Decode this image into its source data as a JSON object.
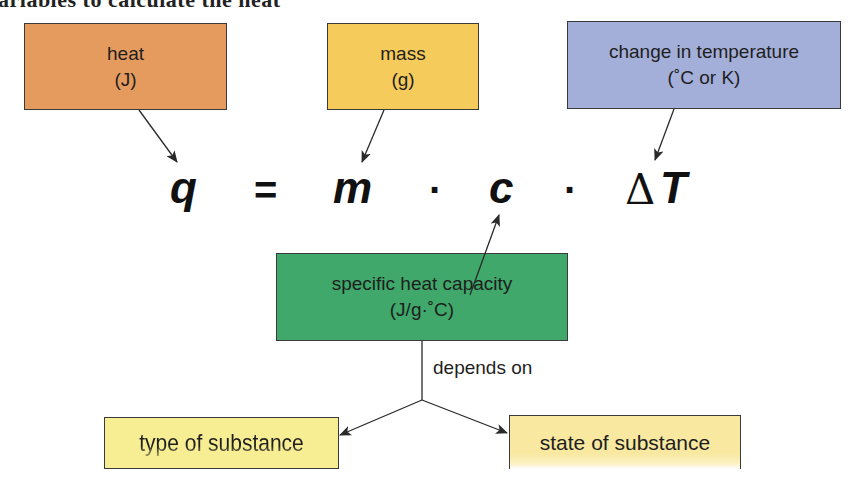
{
  "caption": {
    "partial_text": "ariables to calculate the heat"
  },
  "equation": {
    "lhs": "q",
    "equals": "=",
    "term_mass": "m",
    "dot_1": "·",
    "term_specific_heat": "c",
    "dot_2": "·",
    "delta": "Δ",
    "term_temperature": "T"
  },
  "boxes": {
    "heat": {
      "title": "heat",
      "unit": "(J)",
      "color": "#E59A5E"
    },
    "mass": {
      "title": "mass",
      "unit": "(g)",
      "color": "#F5CB5C"
    },
    "temperature": {
      "title": "change in temperature",
      "unit": "(˚C or K)",
      "color": "#A4AFD9"
    },
    "specific_heat": {
      "title": "specific heat capacity",
      "unit": "(J/g·˚C)",
      "color": "#3FA86A"
    },
    "type_of_substance": {
      "title": "type of substance",
      "color": "#F7EE93"
    },
    "state_of_substance": {
      "title": "state of substance",
      "color": "#F8E8A0"
    }
  },
  "relation": {
    "depends_on_label": "depends on"
  },
  "colors": {
    "border": "#3a3a3a",
    "arrow": "#2a2a2a",
    "text": "#1e1e1e"
  }
}
